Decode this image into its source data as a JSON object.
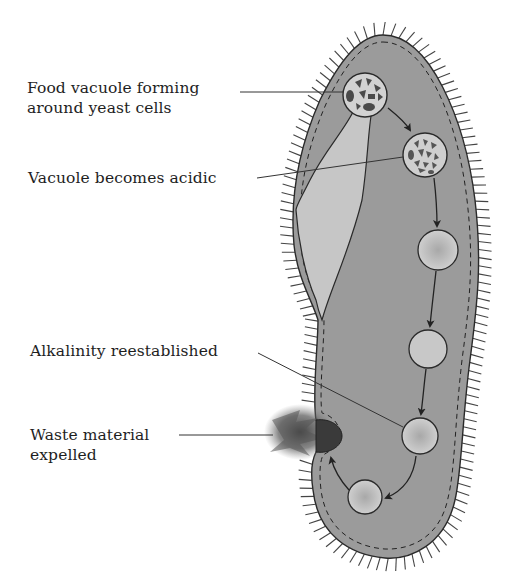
{
  "diagram": {
    "organism": "paramecium",
    "colors": {
      "cytoplasm": "#9a9a9a",
      "oral_groove": "#c4c4c4",
      "vacuole_fill": "#c9c9c9",
      "outline": "#2a2a2a",
      "waste": "#3a3a3a",
      "background": "#ffffff"
    },
    "labels": [
      {
        "id": "food-vacuole-forming",
        "lines": [
          "Food vacuole forming",
          "around yeast cells"
        ]
      },
      {
        "id": "vacuole-acidic",
        "lines": [
          "Vacuole becomes acidic"
        ]
      },
      {
        "id": "alkalinity-reestablished",
        "lines": [
          "Alkalinity reestablished"
        ]
      },
      {
        "id": "waste-expelled",
        "lines": [
          "Waste material",
          "expelled"
        ]
      }
    ],
    "stages": [
      {
        "step": 1,
        "name": "food vacuole forming",
        "contents": "yeast cells"
      },
      {
        "step": 2,
        "name": "vacuole acidic",
        "contents": "digesting yeast"
      },
      {
        "step": 3,
        "name": "digesting vacuole"
      },
      {
        "step": 4,
        "name": "digesting vacuole"
      },
      {
        "step": 5,
        "name": "alkaline vacuole"
      },
      {
        "step": 6,
        "name": "small vacuole"
      },
      {
        "step": 7,
        "name": "waste expelled at anal pore"
      }
    ]
  }
}
